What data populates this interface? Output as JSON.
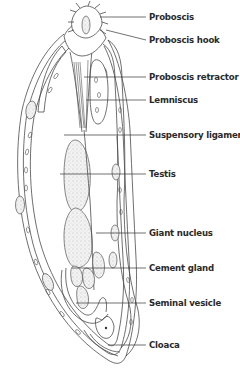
{
  "figure": {
    "labels": [
      {
        "id": "proboscis",
        "text": "Proboscis"
      },
      {
        "id": "proboscis-hook",
        "text": "Proboscis hook"
      },
      {
        "id": "proboscis-retractor",
        "text": "Proboscis retractor"
      },
      {
        "id": "lemniscus",
        "text": "Lemniscus"
      },
      {
        "id": "suspensory-ligament",
        "text": "Suspensory ligament"
      },
      {
        "id": "testis",
        "text": "Testis"
      },
      {
        "id": "giant-nucleus",
        "text": "Giant nucleus"
      },
      {
        "id": "cement-gland",
        "text": "Cement gland"
      },
      {
        "id": "seminal-vesicle",
        "text": "Seminal vesicle"
      },
      {
        "id": "cloaca",
        "text": "Cloaca"
      }
    ],
    "colors": {
      "line": "#4a4a4a",
      "text": "#2a2a2a",
      "background": "#ffffff"
    }
  }
}
